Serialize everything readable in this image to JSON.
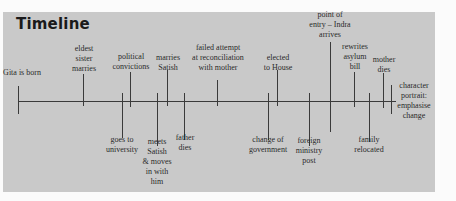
{
  "title": "Timeline",
  "events": [
    {
      "id": "gita-born",
      "label": "Gita is born",
      "x": 18,
      "tick_top": 86,
      "tick_bottom": 114,
      "side": "above",
      "label_x": 22,
      "label_y": 68
    },
    {
      "id": "eldest-sister-marries",
      "label": "eldest\nsister\nmarries",
      "x": 83,
      "tick_top": 74,
      "tick_bottom": 106,
      "side": "above",
      "label_x": 84,
      "label_y": 44
    },
    {
      "id": "goes-to-university",
      "label": "goes to\nuniversity",
      "x": 122,
      "tick_top": 93,
      "tick_bottom": 138,
      "side": "below",
      "label_x": 122,
      "label_y": 135
    },
    {
      "id": "political-convictions",
      "label": "political\nconvictions",
      "x": 130,
      "tick_top": 72,
      "tick_bottom": 107,
      "side": "above",
      "label_x": 131,
      "label_y": 52
    },
    {
      "id": "meets-satish",
      "label": "meets\nSatish\n& moves\nin with\nhim",
      "x": 157,
      "tick_top": 93,
      "tick_bottom": 146,
      "side": "below",
      "label_x": 157,
      "label_y": 137
    },
    {
      "id": "marries-satish",
      "label": "marries\nSatish",
      "x": 167,
      "tick_top": 70,
      "tick_bottom": 106,
      "side": "above",
      "label_x": 168,
      "label_y": 53
    },
    {
      "id": "father-dies",
      "label": "father\ndies",
      "x": 184,
      "tick_top": 93,
      "tick_bottom": 140,
      "side": "below",
      "label_x": 185,
      "label_y": 133
    },
    {
      "id": "failed-attempt",
      "label": "failed attempt\nat reconciliation\nwith mother",
      "x": 217,
      "tick_top": 80,
      "tick_bottom": 106,
      "side": "above",
      "label_x": 218,
      "label_y": 43
    },
    {
      "id": "change-of-government",
      "label": "change of\ngovernment",
      "x": 268,
      "tick_top": 93,
      "tick_bottom": 140,
      "side": "below",
      "label_x": 268,
      "label_y": 135
    },
    {
      "id": "elected-to-house",
      "label": "elected\nto House",
      "x": 277,
      "tick_top": 70,
      "tick_bottom": 106,
      "side": "above",
      "label_x": 278,
      "label_y": 53
    },
    {
      "id": "foreign-ministry-post",
      "label": "foreign\nministry\npost",
      "x": 309,
      "tick_top": 93,
      "tick_bottom": 146,
      "side": "below",
      "label_x": 309,
      "label_y": 136
    },
    {
      "id": "point-of-entry",
      "label": "point of\nentry – Indra\narrives",
      "x": 330,
      "tick_top": 42,
      "tick_bottom": 132,
      "side": "above",
      "label_x": 330,
      "label_y": 10
    },
    {
      "id": "rewrites-asylum-bill",
      "label": "rewrites\nasylum\nbill",
      "x": 354,
      "tick_top": 72,
      "tick_bottom": 107,
      "side": "above",
      "label_x": 355,
      "label_y": 42
    },
    {
      "id": "family-relocated",
      "label": "family\nrelocated",
      "x": 369,
      "tick_top": 93,
      "tick_bottom": 142,
      "side": "below",
      "label_x": 369,
      "label_y": 135
    },
    {
      "id": "mother-dies",
      "label": "mother\ndies",
      "x": 383,
      "tick_top": 73,
      "tick_bottom": 108,
      "side": "above",
      "label_x": 384,
      "label_y": 55
    },
    {
      "id": "character-portrait",
      "label": "character\nportrait:\nemphasise\nchange",
      "x": 391,
      "tick_top": 85,
      "tick_bottom": 114,
      "side": "right",
      "label_x": 414,
      "label_y": 81
    }
  ]
}
